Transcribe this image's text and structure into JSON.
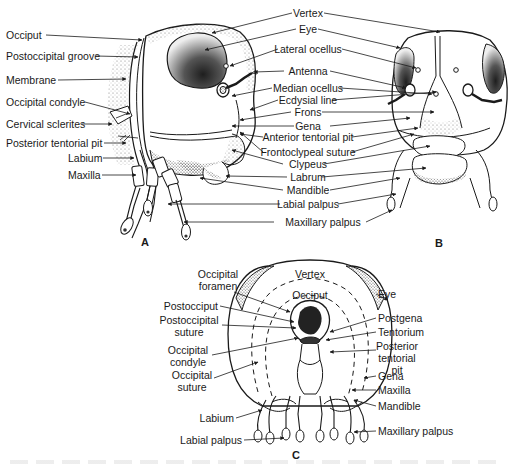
{
  "figure": {
    "panels": [
      "A",
      "B",
      "C"
    ]
  },
  "panel_a": {
    "left_labels": [
      "Occiput",
      "Postoccipital groove",
      "Membrane",
      "Occipital condyle",
      "Cervical sclerites",
      "Posterior tentorial pit",
      "Labium",
      "Maxilla"
    ]
  },
  "center_labels": [
    "Vertex",
    "Eye",
    "Lateral ocellus",
    "Antenna",
    "Median ocellus",
    "Ecdysial line",
    "Frons",
    "Gena",
    "Anterior tentorial pit",
    "Frontoclypeal suture",
    "Clypeus",
    "Labrum",
    "Mandible",
    "Labial palpus",
    "Maxillary palpus"
  ],
  "panel_c": {
    "inner_labels": [
      "Vertex",
      "Occiput"
    ],
    "left_labels": [
      "Occipital\nforamen",
      "Postocciput",
      "Postoccipital\nsuture",
      "Occipital\ncondyle",
      "Occipital\nsuture",
      "Labium",
      "Labial palpus"
    ],
    "right_labels": [
      "Eye",
      "Postgena",
      "Tentorium",
      "Posterior\ntentorial\npit",
      "Gena",
      "Maxilla",
      "Mandible",
      "Maxillary palpus"
    ]
  },
  "colors": {
    "ink": "#1a1a1a",
    "stipple": "#bdbdbd",
    "eye_dark": "#3a3a3a",
    "background": "#ffffff"
  }
}
